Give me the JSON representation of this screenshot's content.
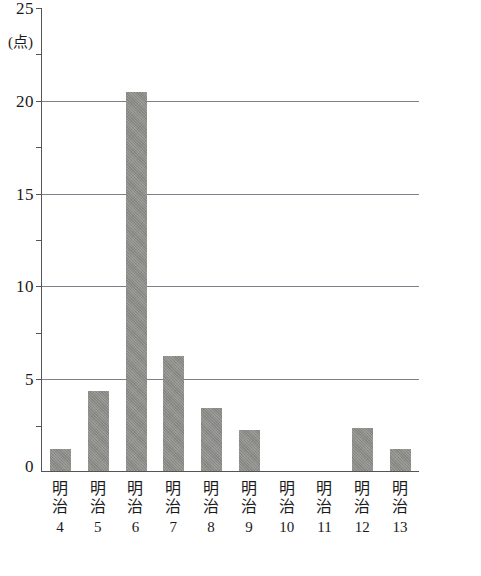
{
  "chart_data": {
    "type": "bar",
    "title": "",
    "subtitle": "",
    "xlabel": "",
    "ylabel": "",
    "y_unit_label": "(点)",
    "categories": [
      "明治4",
      "明治5",
      "明治6",
      "明治7",
      "明治8",
      "明治9",
      "明治10",
      "明治11",
      "明治12",
      "明治13"
    ],
    "category_era": [
      "明治",
      "明治",
      "明治",
      "明治",
      "明治",
      "明治",
      "明治",
      "明治",
      "明治",
      "明治"
    ],
    "category_year": [
      "4",
      "5",
      "6",
      "7",
      "8",
      "9",
      "10",
      "11",
      "12",
      "13"
    ],
    "values": [
      1.2,
      4.3,
      20.4,
      6.2,
      3.4,
      2.2,
      0,
      0,
      2.3,
      1.2
    ],
    "ylim": [
      0,
      25
    ],
    "ytick_labels": [
      "0",
      "5",
      "10",
      "15",
      "20",
      "25"
    ],
    "ytick_values": [
      0,
      5,
      10,
      15,
      20,
      25
    ],
    "gridline_values": [
      5,
      10,
      15,
      20
    ],
    "grid": true,
    "legend": "none",
    "bar_color": "#8a8a86",
    "axis_color": "#555555",
    "grid_color": "#7b8089"
  }
}
